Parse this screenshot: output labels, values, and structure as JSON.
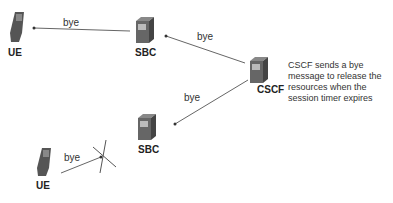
{
  "nodes": {
    "ue_top": {
      "label": "UE"
    },
    "sbc_top": {
      "label": "SBC"
    },
    "cscf": {
      "label": "CSCF"
    },
    "sbc_bottom": {
      "label": "SBC"
    },
    "ue_bottom": {
      "label": "UE"
    }
  },
  "messages": {
    "sbc_to_ue": "bye",
    "cscf_to_sbc_top": "bye",
    "cscf_to_sbc_bottom": "bye",
    "ue_to_blocked": "bye"
  },
  "note": "CSCF sends a bye message to release the resources when the session timer expires",
  "colors": {
    "line": "#555555",
    "device": "#666666"
  }
}
